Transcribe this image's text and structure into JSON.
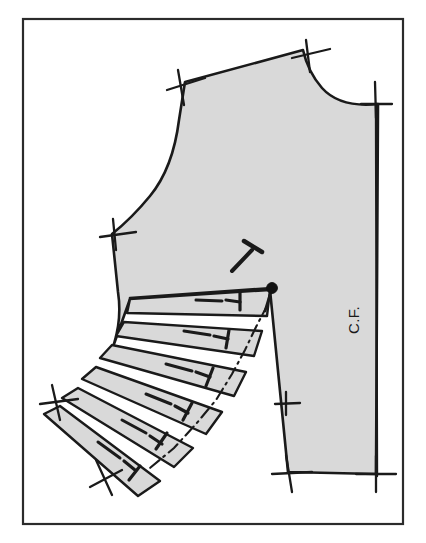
{
  "figure": {
    "kind": "sewing-pattern-drafting-diagram",
    "frame": {
      "label": "image-border",
      "x": 23,
      "y": 19,
      "width": 380,
      "height": 505,
      "stroke": "#2b2b2b",
      "stroke_width": 2.2
    },
    "colors": {
      "ink": "#1a1a1a",
      "fill": "#d9d9d9",
      "paper": "#ffffff",
      "frame": "#2b2b2b"
    }
  },
  "labels": {
    "center_front": "C.F."
  },
  "annotations": {
    "bust_point_name": "bust-point-apex",
    "grain_mark_name": "dart-pivot-t-mark",
    "spread_name": "slash-and-spread-fan"
  },
  "pattern": {
    "bodice_outline_path": "M 185 82 L 179 120 Q 173 168 150 196 Q 132 218 112 234 L 118 292 Q 122 318 114 344 L 130 299 L 270 290 L 288 472 L 376 474 L 378 104 Q 340 108 322 88 Q 308 72 303 50 L 185 82 Z",
    "outline_stroke_width": 2.6,
    "dart_legs": [
      {
        "name": "dart-leg-upper",
        "x1": 272,
        "y1": 288,
        "x2": 130,
        "y2": 298
      },
      {
        "name": "dart-leg-lower",
        "x1": 272,
        "y1": 288,
        "x2": 265,
        "y2": 311
      }
    ],
    "bust_point": {
      "cx": 272,
      "cy": 288,
      "r": 5.4
    },
    "grain_t_mark": {
      "stem": {
        "x1": 232,
        "y1": 271,
        "x2": 252,
        "y2": 250
      },
      "bar": {
        "x1": 244,
        "y1": 241,
        "x2": 262,
        "y2": 252
      }
    },
    "center_front_line": {
      "x1": 376,
      "y1": 104,
      "x2": 377,
      "y2": 476
    },
    "cf_text": {
      "x": 359,
      "y": 320,
      "rotation": -90
    },
    "notches": [
      {
        "name": "notch-shoulder-left",
        "x1": 178,
        "y1": 70,
        "x2": 184,
        "y2": 105,
        "x3": 167,
        "y3": 90,
        "x4": 205,
        "y4": 78
      },
      {
        "name": "notch-shoulder-right",
        "x1": 306,
        "y1": 40,
        "x2": 310,
        "y2": 72,
        "x3": 292,
        "y3": 58,
        "x4": 330,
        "y4": 49
      },
      {
        "name": "notch-neck-right",
        "x1": 375,
        "y1": 82,
        "x2": 376,
        "y2": 118,
        "x3": 361,
        "y3": 104,
        "x4": 392,
        "y4": 104
      },
      {
        "name": "notch-armhole-under",
        "x1": 113,
        "y1": 219,
        "x2": 116,
        "y2": 250,
        "x3": 100,
        "y3": 237,
        "x4": 136,
        "y4": 232
      },
      {
        "name": "notch-side-waist",
        "x1": 286,
        "y1": 392,
        "x2": 286,
        "y2": 415,
        "x3": 275,
        "y3": 404,
        "x4": 300,
        "y4": 403
      },
      {
        "name": "notch-hem-left",
        "x1": 286,
        "y1": 455,
        "x2": 292,
        "y2": 492,
        "x3": 272,
        "y3": 474,
        "x4": 312,
        "y4": 472
      },
      {
        "name": "notch-hem-right",
        "x1": 376,
        "y1": 456,
        "x2": 376,
        "y2": 492,
        "x3": 356,
        "y3": 474,
        "x4": 396,
        "y4": 474
      },
      {
        "name": "notch-spread-top",
        "x1": 52,
        "y1": 385,
        "x2": 60,
        "y2": 420,
        "x3": 40,
        "y3": 404,
        "x4": 78,
        "y4": 399
      },
      {
        "name": "notch-spread-bottom",
        "x1": 96,
        "y1": 460,
        "x2": 112,
        "y2": 495,
        "x3": 90,
        "y3": 487,
        "x4": 122,
        "y4": 470
      }
    ],
    "dash_dot_edge": "M 268 304 L 256 327 L 245 350 L 232 374 L 216 400 L 196 424 L 174 448 L 150 468",
    "spread_segments": [
      {
        "name": "spread-segment-1",
        "path": "M 130 299 L 270 290 L 267 316 L 127 313 Z",
        "tick": {
          "x1": 196,
          "y1": 300,
          "x2": 222,
          "y2": 301
        },
        "tee": {
          "stem": {
            "x1": 226,
            "y1": 300,
            "x2": 240,
            "y2": 302
          },
          "bar": {
            "x1": 240,
            "y1": 292,
            "x2": 240,
            "y2": 310
          }
        }
      },
      {
        "name": "spread-segment-2",
        "path": "M 124 322 L 262 331 L 254 356 L 116 336 Z",
        "tick": {
          "x1": 184,
          "y1": 331,
          "x2": 210,
          "y2": 335
        },
        "tee": {
          "stem": {
            "x1": 214,
            "y1": 336,
            "x2": 228,
            "y2": 339
          },
          "bar": {
            "x1": 229,
            "y1": 330,
            "x2": 226,
            "y2": 348
          }
        }
      },
      {
        "name": "spread-segment-3",
        "path": "M 112 345 L 246 372 L 234 396 L 100 358 Z",
        "tick": {
          "x1": 166,
          "y1": 364,
          "x2": 192,
          "y2": 371
        },
        "tee": {
          "stem": {
            "x1": 196,
            "y1": 372,
            "x2": 210,
            "y2": 377
          },
          "bar": {
            "x1": 213,
            "y1": 368,
            "x2": 206,
            "y2": 386
          }
        }
      },
      {
        "name": "spread-segment-4",
        "path": "M 96 367 L 222 412 L 206 434 L 82 379 Z",
        "tick": {
          "x1": 146,
          "y1": 394,
          "x2": 171,
          "y2": 404
        },
        "tee": {
          "stem": {
            "x1": 175,
            "y1": 406,
            "x2": 188,
            "y2": 413
          },
          "bar": {
            "x1": 192,
            "y1": 403,
            "x2": 183,
            "y2": 420
          }
        }
      },
      {
        "name": "spread-segment-5",
        "path": "M 78 388 L 193 448 L 174 467 L 62 398 Z",
        "tick": {
          "x1": 122,
          "y1": 420,
          "x2": 146,
          "y2": 433
        },
        "tee": {
          "stem": {
            "x1": 150,
            "y1": 436,
            "x2": 162,
            "y2": 444
          },
          "bar": {
            "x1": 167,
            "y1": 433,
            "x2": 156,
            "y2": 449
          }
        }
      },
      {
        "name": "spread-segment-6",
        "path": "M 60 406 L 160 481 L 138 496 L 44 414 Z",
        "tick": {
          "x1": 98,
          "y1": 442,
          "x2": 120,
          "y2": 458
        },
        "tee": {
          "stem": {
            "x1": 124,
            "y1": 461,
            "x2": 135,
            "y2": 470
          },
          "bar": {
            "x1": 140,
            "y1": 466,
            "x2": 129,
            "y2": 480
          }
        }
      }
    ]
  }
}
